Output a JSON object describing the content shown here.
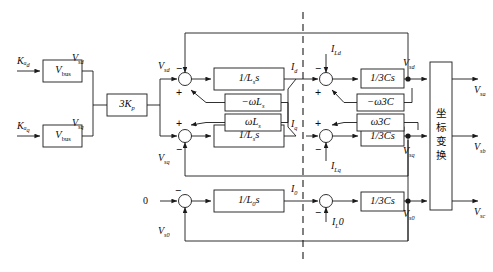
{
  "diagram": {
    "divider_name": "dashed-separator"
  },
  "inputs": {
    "kd": "Kₐ",
    "kq": "Kₐ",
    "kd_sub": "d",
    "kq_sub": "q",
    "zero": "0"
  },
  "blocks": {
    "vbus_top": "V",
    "vbus_top_sub": "bus",
    "vbus_bot": "V",
    "vbus_bot_sub": "bus",
    "gain": "3K",
    "gain_sub": "p",
    "ind_d": "1/L",
    "ind_d_sub": "s",
    "ind_d_tail": "s",
    "ind_q": "1/L",
    "ind_q_sub": "s",
    "ind_q_tail": "s",
    "ind_0": "1/L",
    "ind_0_sub": "0",
    "ind_0_tail": "s",
    "coupl_neg": "−ωL",
    "coupl_neg_sub": "s",
    "coupl_pos": "ωL",
    "coupl_pos_sub": "s",
    "cap_d": "1/3Cs",
    "cap_q": "1/3Cs",
    "cap_0": "1/3Cs",
    "ccoupl_neg": "−ω3C",
    "ccoupl_pos": "ω3C",
    "transform": [
      "坐",
      "标",
      "变",
      "换"
    ]
  },
  "signals": {
    "vsd_ref": "V",
    "vsd_ref_sub": "sd",
    "vsq_ref": "V",
    "vsq_ref_sub": "sq",
    "vsd_fb": "V",
    "vsd_fb_sub": "sd",
    "vsq_fb": "V",
    "vsq_fb_sub": "sq",
    "vsd_out": "V",
    "vsd_out_sub": "sd",
    "vsq_out": "V",
    "vsq_out_sub": "sq",
    "vs0_fb": "V",
    "vs0_fb_sub": "s0",
    "vs0_out": "V",
    "vs0_out_sub": "s0",
    "id": "I",
    "id_sub": "d",
    "iq": "I",
    "iq_sub": "q",
    "i0": "I",
    "i0_sub": "0",
    "ild": "I",
    "ild_sub": "Ld",
    "ilq": "I",
    "ilq_sub": "Lq",
    "il0": "I",
    "il0_sub": "L",
    "il0_tail": "0"
  },
  "outputs": {
    "vsa": "V",
    "vsa_sub": "sa",
    "vsb": "V",
    "vsb_sub": "sb",
    "vsc": "V",
    "vsc_sub": "sc"
  },
  "signs": {
    "minus": "−",
    "plus": "+"
  }
}
